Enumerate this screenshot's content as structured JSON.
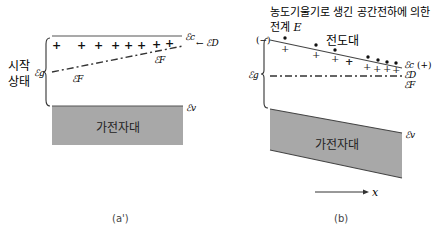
{
  "panel_a": {
    "caption": "(a')",
    "state_label_line1": "시작",
    "state_label_line2": "상태",
    "bandgap_label": "ℰg",
    "conduction_label": "ℰc",
    "donor_label": "← ℰD",
    "fermi_label_right": "ℰF",
    "fermi_label_left": "ℰF",
    "valence_label": "ℰv",
    "valence_band_text": "가전자대",
    "donor_plus_count": 8,
    "donor_symbol": "+"
  },
  "panel_b": {
    "caption": "(b)",
    "title_line1": "농도기울기로 생긴 공간전하에 의한",
    "title_line2_prefix": "전계 ",
    "title_line2_symbol": "E",
    "minus_sign": "(−)",
    "plus_sign": "(+)",
    "conduction_band_text": "전도대",
    "bandgap_label": "ℰg",
    "conduction_label": "ℰc",
    "donor_label": "ℰD",
    "fermi_label": "ℰF",
    "valence_label": "ℰv",
    "valence_band_text": "가전자대",
    "x_axis_label": "x",
    "donor_symbol": "+",
    "electron_symbol": "•"
  },
  "colors": {
    "line": "#555555",
    "band_fill": "#a8a8a8",
    "text": "#222222"
  }
}
